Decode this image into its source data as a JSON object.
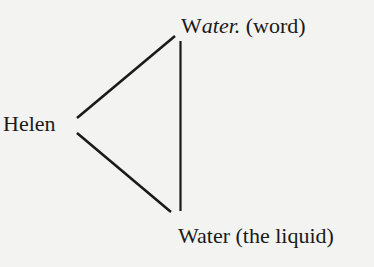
{
  "nodes": {
    "helen": {
      "label": "Helen"
    },
    "word": {
      "label_main": "W",
      "label_italic": "ater.",
      "label_rest": " (word)"
    },
    "liquid": {
      "label": "Water (the liquid)"
    }
  },
  "edges": [
    {
      "from": "helen",
      "to": "word"
    },
    {
      "from": "helen",
      "to": "liquid"
    },
    {
      "from": "word",
      "to": "liquid"
    }
  ],
  "colors": {
    "background": "#f3f3f1",
    "ink": "#1a1a1a"
  }
}
